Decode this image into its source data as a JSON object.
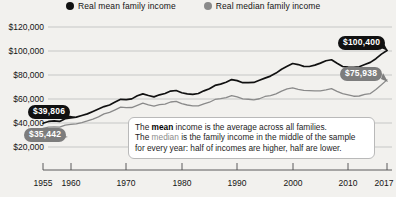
{
  "legend": {
    "items": [
      {
        "label": "Real mean family income",
        "icon": "filled-circle-icon",
        "color": "#111111"
      },
      {
        "label": "Real median family income",
        "icon": "filled-circle-icon",
        "color": "#8a8a8a"
      }
    ]
  },
  "annotation": {
    "line1_a": "The ",
    "line1_bold": "mean",
    "line1_b": " income is the average across all families.",
    "line2_a": "The ",
    "line2_med": "median",
    "line2_b": " is the family income in the middle of the sample",
    "line3": "for every year: half of incomes are higher, half are lower."
  },
  "callouts": {
    "mean_start": "$39,806",
    "median_start": "$35,442",
    "mean_end": "$100,400",
    "median_end": "$75,938"
  },
  "chart_data": {
    "type": "line",
    "title": "",
    "xlabel": "",
    "ylabel": "",
    "xlim": [
      1955,
      2017
    ],
    "ylim": [
      20000,
      120000
    ],
    "grid": true,
    "legend_position": "top",
    "ytick_labels": [
      "$120,000",
      "$100,000",
      "$80,000",
      "$60,000",
      "$40,000",
      "$20,000"
    ],
    "yticks": [
      120000,
      100000,
      80000,
      60000,
      40000,
      20000
    ],
    "xtick_labels": [
      "1955",
      "1960",
      "1970",
      "1980",
      "1990",
      "2000",
      "2010",
      "2017"
    ],
    "xticks": [
      1955,
      1960,
      1970,
      1980,
      1990,
      2000,
      2010,
      2017
    ],
    "x": [
      1955,
      1956,
      1957,
      1958,
      1959,
      1960,
      1961,
      1962,
      1963,
      1964,
      1965,
      1966,
      1967,
      1968,
      1969,
      1970,
      1971,
      1972,
      1973,
      1974,
      1975,
      1976,
      1977,
      1978,
      1979,
      1980,
      1981,
      1982,
      1983,
      1984,
      1985,
      1986,
      1987,
      1988,
      1989,
      1990,
      1991,
      1992,
      1993,
      1994,
      1995,
      1996,
      1997,
      1998,
      1999,
      2000,
      2001,
      2002,
      2003,
      2004,
      2005,
      2006,
      2007,
      2008,
      2009,
      2010,
      2011,
      2012,
      2013,
      2014,
      2015,
      2016,
      2017
    ],
    "series": [
      {
        "name": "Real mean family income",
        "color": "#111111",
        "values": [
          39806,
          41300,
          41700,
          41300,
          43600,
          44200,
          44900,
          46300,
          47600,
          49600,
          51600,
          53700,
          55000,
          57400,
          59700,
          59500,
          60100,
          62700,
          64300,
          62900,
          61800,
          63500,
          64600,
          66600,
          67100,
          65200,
          64300,
          63800,
          64600,
          66800,
          68500,
          71300,
          72400,
          74000,
          76200,
          75300,
          73600,
          73700,
          73800,
          75600,
          77400,
          79100,
          81600,
          84800,
          87200,
          89600,
          88700,
          87200,
          87100,
          88200,
          89900,
          91900,
          92700,
          89800,
          87100,
          86600,
          86300,
          86900,
          88700,
          90500,
          93600,
          97400,
          100400
        ]
      },
      {
        "name": "Real median family income",
        "color": "#8a8a8a",
        "values": [
          35442,
          36600,
          36700,
          36500,
          38300,
          38800,
          39200,
          40300,
          41700,
          43300,
          45100,
          47600,
          48900,
          51000,
          53200,
          52800,
          52900,
          54700,
          56600,
          55100,
          54000,
          55300,
          55700,
          57500,
          58100,
          56100,
          55000,
          54200,
          54300,
          56000,
          57300,
          59600,
          60300,
          61200,
          62800,
          61700,
          60100,
          59800,
          59300,
          60200,
          62100,
          62900,
          64300,
          66600,
          68400,
          69200,
          68100,
          67200,
          66900,
          66700,
          66800,
          67600,
          68600,
          66400,
          64400,
          63500,
          62300,
          62500,
          63800,
          64500,
          68000,
          71800,
          75938
        ]
      }
    ]
  }
}
